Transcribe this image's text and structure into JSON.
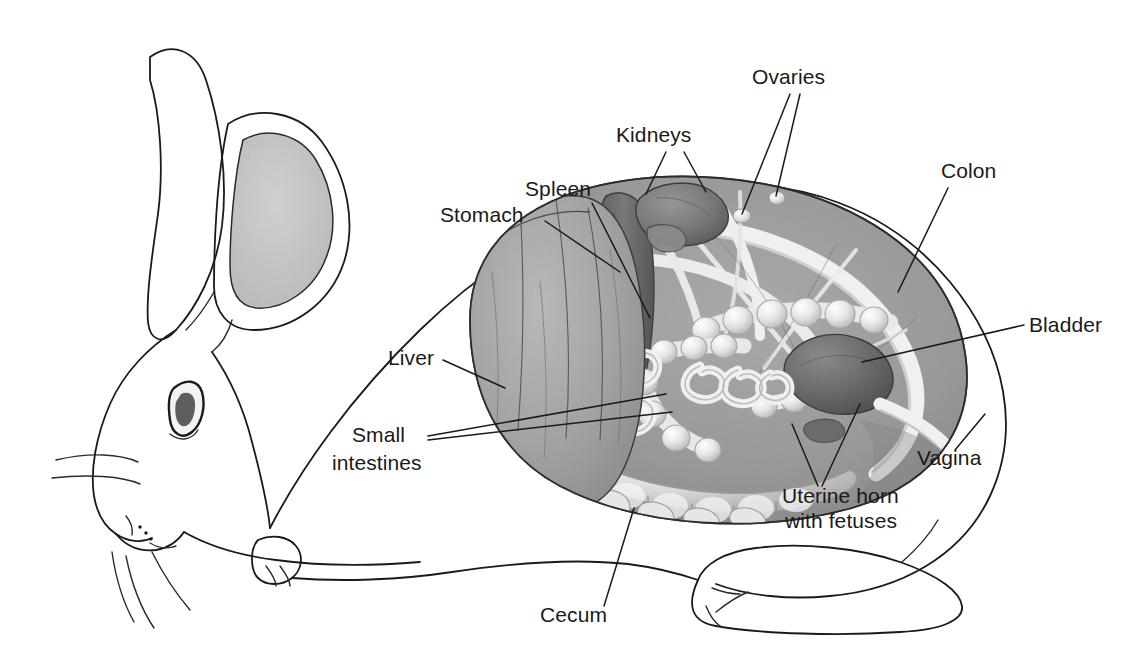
{
  "figure": {
    "view": "lateral-left",
    "background_color": "#ffffff",
    "line_color": "#1a1a1a",
    "palette": {
      "ear_fill": "#c9c9c9",
      "liver_fill": "#a3a3a3",
      "abdomen_fill": "#9e9e9e",
      "spleen_fill": "#6f6f6f",
      "kidney_fill": "#7b7b7b",
      "bladder_fill": "#6a6a6a",
      "intestine_highlight": "#f2f2f2",
      "cecum_fill": "#cfcfcf",
      "eye_fill": "#5e5e5e"
    }
  },
  "labels": [
    {
      "id": "ovaries",
      "text": "Ovaries",
      "x": 752,
      "y": 84,
      "anchor": "start",
      "leaders": [
        "M 790 94 L 742 214",
        "M 800 94 L 776 196"
      ]
    },
    {
      "id": "kidneys",
      "text": "Kidneys",
      "x": 616,
      "y": 142,
      "anchor": "start",
      "leaders": [
        "M 666 152 L 646 194",
        "M 684 152 L 706 192"
      ]
    },
    {
      "id": "spleen",
      "text": "Spleen",
      "x": 525,
      "y": 196,
      "anchor": "start",
      "leaders": [
        "M 592 203 L 650 318"
      ]
    },
    {
      "id": "colon",
      "text": "Colon",
      "x": 941,
      "y": 178,
      "anchor": "start",
      "leaders": [
        "M 948 188 L 898 292"
      ]
    },
    {
      "id": "stomach",
      "text": "Stomach",
      "x": 440,
      "y": 222,
      "anchor": "start",
      "leaders": [
        "M 545 221 L 620 272"
      ]
    },
    {
      "id": "bladder",
      "text": "Bladder",
      "x": 1029,
      "y": 332,
      "anchor": "start",
      "leaders": [
        "M 1024 325 L 862 362"
      ]
    },
    {
      "id": "liver",
      "text": "Liver",
      "x": 388,
      "y": 365,
      "anchor": "start",
      "leaders": [
        "M 443 360 L 505 388"
      ]
    },
    {
      "id": "small-intestines-line1",
      "text": "Small",
      "x": 352,
      "y": 442,
      "anchor": "start",
      "leaders": [
        "M 428 436 L 666 394",
        "M 428 440 L 672 412"
      ]
    },
    {
      "id": "small-intestines-line2",
      "text": "intestines",
      "x": 332,
      "y": 470,
      "anchor": "start",
      "leaders": []
    },
    {
      "id": "uterine-horn-line1",
      "text": "Uterine horn",
      "x": 782,
      "y": 503,
      "anchor": "start",
      "leaders": [
        "M 818 486 L 792 424",
        "M 822 486 L 860 404"
      ]
    },
    {
      "id": "uterine-horn-line2",
      "text": "with fetuses",
      "x": 785,
      "y": 528,
      "anchor": "start",
      "leaders": []
    },
    {
      "id": "vagina",
      "text": "Vagina",
      "x": 917,
      "y": 465,
      "anchor": "start",
      "leaders": [
        "M 955 450 L 985 414"
      ]
    },
    {
      "id": "cecum",
      "text": "Cecum",
      "x": 540,
      "y": 622,
      "anchor": "start",
      "leaders": [
        "M 604 606 L 634 508"
      ]
    }
  ],
  "organs": [
    {
      "id": "liver",
      "name": "Liver",
      "tone": "mid-gray"
    },
    {
      "id": "stomach",
      "name": "Stomach",
      "tone": "mid-gray"
    },
    {
      "id": "spleen",
      "name": "Spleen",
      "tone": "dark-gray"
    },
    {
      "id": "kidneys",
      "name": "Kidneys",
      "tone": "dark-gray",
      "count": 2
    },
    {
      "id": "ovaries",
      "name": "Ovaries",
      "tone": "light-gray",
      "count": 2
    },
    {
      "id": "colon",
      "name": "Colon",
      "tone": "light-gray"
    },
    {
      "id": "bladder",
      "name": "Bladder",
      "tone": "dark-gray"
    },
    {
      "id": "small-intestines",
      "name": "Small intestines",
      "tone": "light-gray"
    },
    {
      "id": "cecum",
      "name": "Cecum",
      "tone": "light-gray"
    },
    {
      "id": "uterine-horn",
      "name": "Uterine horn with fetuses",
      "tone": "light-gray"
    },
    {
      "id": "vagina",
      "name": "Vagina",
      "tone": "outline-only"
    }
  ]
}
